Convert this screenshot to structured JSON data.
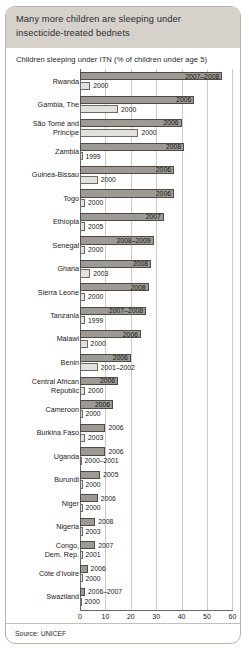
{
  "card": {
    "title": "Many more children are sleeping under insecticide-treated bednets",
    "subtitle": "Children sleeping under ITN (% of children under age 5)",
    "source": "Source: UNICEF"
  },
  "chart_data": {
    "type": "bar",
    "orientation": "horizontal",
    "title": "Many more children are sleeping under insecticide-treated bednets",
    "xlabel": "Children sleeping under ITN (% of children under age 5)",
    "ylabel": "",
    "xlim": [
      0,
      60
    ],
    "xticks": [
      0,
      10,
      20,
      30,
      40,
      50,
      60
    ],
    "grid": true,
    "legend": "none",
    "series": [
      {
        "name": "recent",
        "color": "#9d9a95"
      },
      {
        "name": "baseline",
        "color": "#e3e1dd"
      }
    ],
    "categories": [
      "Rwanda",
      "Gambia, The",
      "São Tomé and Principe",
      "Zambia",
      "Guinea-Bissau",
      "Togo",
      "Ethiopia",
      "Senegal",
      "Ghana",
      "Sierra Leone",
      "Tanzania",
      "Malawi",
      "Benin",
      "Central African Republic",
      "Cameroon",
      "Burkina Faso",
      "Uganda",
      "Burundi",
      "Niger",
      "Nigeria",
      "Congo, Dem. Rep.",
      "Côte d'Ivoire",
      "Swaziland"
    ],
    "rows": [
      {
        "country": "Rwanda",
        "lines": [
          "Rwanda"
        ],
        "recent_year": "2007–2008",
        "recent_value": 56,
        "recent_label_inside": true,
        "base_year": "2000",
        "base_value": 4
      },
      {
        "country": "Gambia, The",
        "lines": [
          "Gambia, The"
        ],
        "recent_year": "2006",
        "recent_value": 45,
        "recent_label_inside": true,
        "base_year": "2000",
        "base_value": 15
      },
      {
        "country": "São Tomé and Principe",
        "lines": [
          "São Tomé and",
          "Principe"
        ],
        "recent_year": "2006",
        "recent_value": 40,
        "recent_label_inside": true,
        "base_year": "2000",
        "base_value": 23
      },
      {
        "country": "Zambia",
        "lines": [
          "Zambia"
        ],
        "recent_year": "2008",
        "recent_value": 41,
        "recent_label_inside": true,
        "base_year": "1999",
        "base_value": 1
      },
      {
        "country": "Guinea-Bissau",
        "lines": [
          "Guinea-Bissau"
        ],
        "recent_year": "2006",
        "recent_value": 37,
        "recent_label_inside": true,
        "base_year": "2000",
        "base_value": 7
      },
      {
        "country": "Togo",
        "lines": [
          "Togo"
        ],
        "recent_year": "2006",
        "recent_value": 37,
        "recent_label_inside": true,
        "base_year": "2000",
        "base_value": 2
      },
      {
        "country": "Ethiopia",
        "lines": [
          "Ethiopia"
        ],
        "recent_year": "2007",
        "recent_value": 33,
        "recent_label_inside": true,
        "base_year": "2005",
        "base_value": 2
      },
      {
        "country": "Senegal",
        "lines": [
          "Senegal"
        ],
        "recent_year": "2008–2009",
        "recent_value": 29,
        "recent_label_inside": true,
        "base_year": "2000",
        "base_value": 2
      },
      {
        "country": "Ghana",
        "lines": [
          "Ghana"
        ],
        "recent_year": "2008",
        "recent_value": 28,
        "recent_label_inside": true,
        "base_year": "2003",
        "base_value": 4
      },
      {
        "country": "Sierra Leone",
        "lines": [
          "Sierra Leone"
        ],
        "recent_year": "2008",
        "recent_value": 27,
        "recent_label_inside": true,
        "base_year": "2000",
        "base_value": 2
      },
      {
        "country": "Tanzania",
        "lines": [
          "Tanzania"
        ],
        "recent_year": "2007–2008",
        "recent_value": 26,
        "recent_label_inside": true,
        "base_year": "1999",
        "base_value": 2
      },
      {
        "country": "Malawi",
        "lines": [
          "Malawi"
        ],
        "recent_year": "2006",
        "recent_value": 24,
        "recent_label_inside": true,
        "base_year": "2000",
        "base_value": 3
      },
      {
        "country": "Benin",
        "lines": [
          "Benin"
        ],
        "recent_year": "2006",
        "recent_value": 20,
        "recent_label_inside": true,
        "base_year": "2001–2002",
        "base_value": 7
      },
      {
        "country": "Central African Republic",
        "lines": [
          "Central African",
          "Republic"
        ],
        "recent_year": "2006",
        "recent_value": 15,
        "recent_label_inside": true,
        "base_year": "2000",
        "base_value": 2
      },
      {
        "country": "Cameroon",
        "lines": [
          "Cameroon"
        ],
        "recent_year": "2006",
        "recent_value": 13,
        "recent_label_inside": true,
        "base_year": "2000",
        "base_value": 1
      },
      {
        "country": "Burkina Faso",
        "lines": [
          "Burkina Faso"
        ],
        "recent_year": "2006",
        "recent_value": 10,
        "recent_label_inside": false,
        "base_year": "2003",
        "base_value": 2
      },
      {
        "country": "Uganda",
        "lines": [
          "Uganda"
        ],
        "recent_year": "2006",
        "recent_value": 10,
        "recent_label_inside": false,
        "base_year": "2000–2001",
        "base_value": 0
      },
      {
        "country": "Burundi",
        "lines": [
          "Burundi"
        ],
        "recent_year": "2005",
        "recent_value": 8,
        "recent_label_inside": false,
        "base_year": "2000",
        "base_value": 1
      },
      {
        "country": "Niger",
        "lines": [
          "Niger"
        ],
        "recent_year": "2006",
        "recent_value": 7,
        "recent_label_inside": false,
        "base_year": "2000",
        "base_value": 1
      },
      {
        "country": "Nigeria",
        "lines": [
          "Nigeria"
        ],
        "recent_year": "2008",
        "recent_value": 6,
        "recent_label_inside": false,
        "base_year": "2003",
        "base_value": 1
      },
      {
        "country": "Congo, Dem. Rep.",
        "lines": [
          "Congo,",
          "Dem. Rep."
        ],
        "recent_year": "2007",
        "recent_value": 6,
        "recent_label_inside": false,
        "base_year": "2001",
        "base_value": 1
      },
      {
        "country": "Côte d'Ivoire",
        "lines": [
          "Côte d'Ivoire"
        ],
        "recent_year": "2006",
        "recent_value": 3,
        "recent_label_inside": false,
        "base_year": "2000",
        "base_value": 1
      },
      {
        "country": "Swaziland",
        "lines": [
          "Swaziland"
        ],
        "recent_year": "2006–2007",
        "recent_value": 2,
        "recent_label_inside": false,
        "base_year": "2000",
        "base_value": 0
      }
    ]
  }
}
